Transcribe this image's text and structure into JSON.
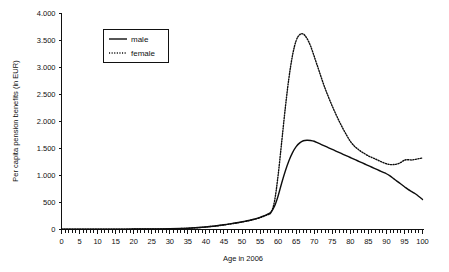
{
  "chart_data": {
    "type": "line",
    "title": "",
    "xlabel": "Age in 2006",
    "ylabel": "Per capita pension benefits (in EUR)",
    "xlim": [
      0,
      100
    ],
    "ylim": [
      0,
      4000
    ],
    "grid": false,
    "legend_position": "upper-left-inset",
    "x_tick_labels": [
      "0",
      "5",
      "10",
      "15",
      "20",
      "25",
      "30",
      "35",
      "40",
      "45",
      "50",
      "55",
      "60",
      "65",
      "70",
      "75",
      "80",
      "85",
      "90",
      "95",
      "100"
    ],
    "x_tick_values": [
      0,
      5,
      10,
      15,
      20,
      25,
      30,
      35,
      40,
      45,
      50,
      55,
      60,
      65,
      70,
      75,
      80,
      85,
      90,
      95,
      100
    ],
    "x_minor_tick_step": 1,
    "y_tick_labels": [
      "0",
      "500",
      "1.000",
      "1.500",
      "2.000",
      "2.500",
      "3.000",
      "3.500",
      "4.000"
    ],
    "y_tick_values": [
      0,
      500,
      1000,
      1500,
      2000,
      2500,
      3000,
      3500,
      4000
    ],
    "x": [
      0,
      5,
      10,
      15,
      20,
      25,
      30,
      33,
      35,
      37,
      39,
      41,
      43,
      45,
      47,
      49,
      51,
      53,
      55,
      56,
      57,
      58,
      59,
      60,
      61,
      62,
      63,
      64,
      65,
      66,
      67,
      68,
      69,
      70,
      71,
      72,
      73,
      74,
      75,
      76,
      77,
      78,
      79,
      80,
      81,
      82,
      83,
      84,
      85,
      86,
      87,
      88,
      89,
      90,
      91,
      92,
      93,
      94,
      95,
      96,
      97,
      98,
      99,
      100
    ],
    "series": [
      {
        "name": "male",
        "style": "solid",
        "values": [
          5,
          5,
          6,
          7,
          8,
          10,
          14,
          18,
          24,
          32,
          42,
          55,
          70,
          88,
          108,
          130,
          155,
          185,
          225,
          250,
          280,
          320,
          430,
          620,
          860,
          1080,
          1270,
          1420,
          1530,
          1600,
          1640,
          1650,
          1645,
          1630,
          1600,
          1570,
          1540,
          1510,
          1480,
          1450,
          1420,
          1390,
          1360,
          1330,
          1300,
          1270,
          1240,
          1210,
          1180,
          1150,
          1120,
          1090,
          1060,
          1030,
          990,
          940,
          890,
          840,
          790,
          740,
          700,
          660,
          610,
          555
        ]
      },
      {
        "name": "female",
        "style": "dotted",
        "values": [
          5,
          5,
          6,
          7,
          8,
          10,
          13,
          17,
          22,
          30,
          40,
          52,
          66,
          84,
          104,
          126,
          150,
          180,
          218,
          244,
          272,
          310,
          520,
          1000,
          1620,
          2250,
          2800,
          3220,
          3490,
          3600,
          3610,
          3530,
          3390,
          3200,
          3000,
          2800,
          2610,
          2440,
          2280,
          2130,
          1990,
          1860,
          1740,
          1630,
          1550,
          1490,
          1440,
          1400,
          1360,
          1330,
          1300,
          1270,
          1240,
          1215,
          1200,
          1200,
          1210,
          1240,
          1280,
          1290,
          1285,
          1295,
          1310,
          1320
        ]
      }
    ],
    "annotations": {
      "male_peak_age": 68,
      "male_peak_value": 1650,
      "female_peak_age": 67,
      "female_peak_value": 3610
    }
  },
  "legend": {
    "items": [
      {
        "label": "male",
        "style": "solid"
      },
      {
        "label": "female",
        "style": "dotted"
      }
    ]
  }
}
